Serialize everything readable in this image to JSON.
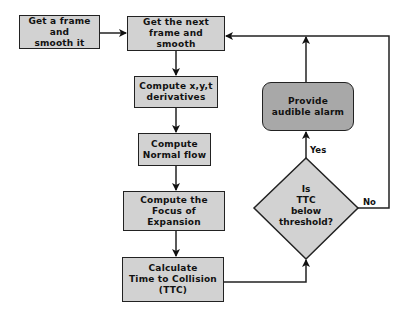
{
  "diagram": {
    "type": "flowchart",
    "colors": {
      "box_fill": "#d2d2d2",
      "alarm_fill": "#a8a8a8",
      "stroke": "#222222"
    },
    "nodes": {
      "get_frame": {
        "label": "Get a frame and\nsmooth it"
      },
      "next_frame": {
        "label": "Get the next\nframe and smooth"
      },
      "derivatives": {
        "label": "Compute x,y,t\nderivatives"
      },
      "normal_flow": {
        "label": "Compute\nNormal flow"
      },
      "foe": {
        "label": "Compute the\nFocus of Expansion"
      },
      "ttc": {
        "label": "Calculate\nTime to Collision\n(TTC)"
      },
      "decision": {
        "label": "Is\nTTC\nbelow\nthreshold?"
      },
      "alarm": {
        "label": "Provide\naudible alarm"
      }
    },
    "edges": {
      "yes_label": "Yes",
      "no_label": "No"
    }
  }
}
